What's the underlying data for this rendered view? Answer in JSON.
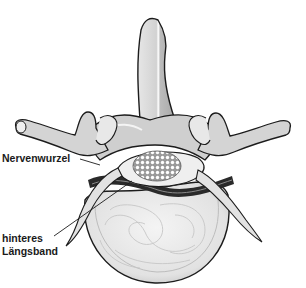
{
  "diagram": {
    "labels": [
      {
        "id": "nerve-root",
        "text": "Nervenwurzel"
      },
      {
        "id": "posterior-ligament",
        "lines": [
          "hinteres",
          "Längsband"
        ]
      }
    ],
    "colors": {
      "outline": "#1c1c1c",
      "bone_light": "#e4e4e4",
      "bone_mid": "#c4c4c4",
      "bone_dark": "#9a9a9a",
      "disc_fill": "#ececec",
      "spinal_cord": "#d8d8d8",
      "ligament_dark": "#2a2a2a",
      "background": "#ffffff"
    }
  }
}
